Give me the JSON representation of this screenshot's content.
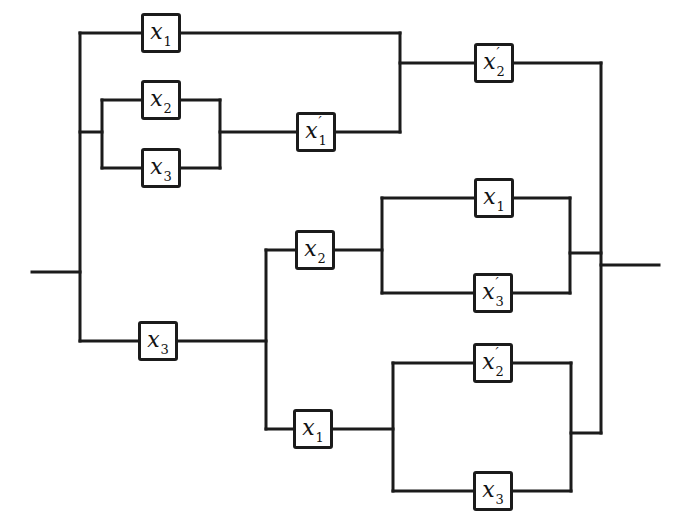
{
  "diagram": {
    "kind": "switching-circuit",
    "canvas": {
      "width": 673,
      "height": 530,
      "background": "#ffffff",
      "stroke": "#1b1b1b",
      "stroke_width": 3
    },
    "boxes": [
      {
        "name": "contact-x1-top",
        "cx": 161,
        "cy": 33,
        "label": {
          "base": "x",
          "prime": "",
          "sub": "1"
        }
      },
      {
        "name": "contact-x2-upper",
        "cx": 161,
        "cy": 100,
        "label": {
          "base": "x",
          "prime": "",
          "sub": "2"
        }
      },
      {
        "name": "contact-x3-upper",
        "cx": 161,
        "cy": 168,
        "label": {
          "base": "x",
          "prime": "",
          "sub": "3"
        }
      },
      {
        "name": "contact-x1-prime",
        "cx": 316,
        "cy": 132,
        "label": {
          "base": "x",
          "prime": "′",
          "sub": "1"
        }
      },
      {
        "name": "contact-x2-prime-top",
        "cx": 494,
        "cy": 63,
        "label": {
          "base": "x",
          "prime": "′",
          "sub": "2"
        }
      },
      {
        "name": "contact-x2-mid",
        "cx": 315,
        "cy": 250,
        "label": {
          "base": "x",
          "prime": "",
          "sub": "2"
        }
      },
      {
        "name": "contact-x1-mid",
        "cx": 494,
        "cy": 198,
        "label": {
          "base": "x",
          "prime": "",
          "sub": "1"
        }
      },
      {
        "name": "contact-x3-prime",
        "cx": 493,
        "cy": 293,
        "label": {
          "base": "x",
          "prime": "′",
          "sub": "3"
        }
      },
      {
        "name": "contact-x3-bottom-left",
        "cx": 158,
        "cy": 341,
        "label": {
          "base": "x",
          "prime": "",
          "sub": "3"
        }
      },
      {
        "name": "contact-x1-bottom",
        "cx": 313,
        "cy": 429,
        "label": {
          "base": "x",
          "prime": "",
          "sub": "1"
        }
      },
      {
        "name": "contact-x2-prime-bottom",
        "cx": 493,
        "cy": 363,
        "label": {
          "base": "x",
          "prime": "′",
          "sub": "2"
        }
      },
      {
        "name": "contact-x3-bottom-right",
        "cx": 493,
        "cy": 491,
        "label": {
          "base": "x",
          "prime": "",
          "sub": "3"
        }
      }
    ],
    "wires": [
      {
        "name": "input-lead",
        "x1": 32,
        "y1": 272,
        "x2": 80,
        "y2": 272
      },
      {
        "name": "left-bus",
        "x1": 80,
        "y1": 33,
        "x2": 80,
        "y2": 341
      },
      {
        "name": "top-branch-in",
        "x1": 80,
        "y1": 33,
        "x2": 145,
        "y2": 33
      },
      {
        "name": "top-branch-out",
        "x1": 177,
        "y1": 33,
        "x2": 400,
        "y2": 33
      },
      {
        "name": "par1-stub",
        "x1": 80,
        "y1": 132,
        "x2": 102,
        "y2": 132
      },
      {
        "name": "par1-left-bracket",
        "x1": 102,
        "y1": 100,
        "x2": 102,
        "y2": 168
      },
      {
        "name": "par1-x2-in",
        "x1": 102,
        "y1": 100,
        "x2": 145,
        "y2": 100
      },
      {
        "name": "par1-x2-out",
        "x1": 177,
        "y1": 100,
        "x2": 220,
        "y2": 100
      },
      {
        "name": "par1-x3-in",
        "x1": 102,
        "y1": 168,
        "x2": 145,
        "y2": 168
      },
      {
        "name": "par1-x3-out",
        "x1": 177,
        "y1": 168,
        "x2": 220,
        "y2": 168
      },
      {
        "name": "par1-right-bracket",
        "x1": 220,
        "y1": 100,
        "x2": 220,
        "y2": 168
      },
      {
        "name": "x1-prime-in",
        "x1": 220,
        "y1": 132,
        "x2": 300,
        "y2": 132
      },
      {
        "name": "x1-prime-out",
        "x1": 332,
        "y1": 132,
        "x2": 400,
        "y2": 132
      },
      {
        "name": "top-merge-bracket",
        "x1": 400,
        "y1": 33,
        "x2": 400,
        "y2": 132
      },
      {
        "name": "x2-prime-top-in",
        "x1": 400,
        "y1": 63,
        "x2": 478,
        "y2": 63
      },
      {
        "name": "x2-prime-top-out",
        "x1": 510,
        "y1": 63,
        "x2": 601,
        "y2": 63
      },
      {
        "name": "right-bus",
        "x1": 601,
        "y1": 63,
        "x2": 601,
        "y2": 433
      },
      {
        "name": "x3-bottom-in",
        "x1": 80,
        "y1": 341,
        "x2": 142,
        "y2": 341
      },
      {
        "name": "x3-bottom-out",
        "x1": 174,
        "y1": 341,
        "x2": 266,
        "y2": 341
      },
      {
        "name": "lower-split-bracket",
        "x1": 266,
        "y1": 250,
        "x2": 266,
        "y2": 429
      },
      {
        "name": "x2-mid-in",
        "x1": 266,
        "y1": 250,
        "x2": 299,
        "y2": 250
      },
      {
        "name": "x2-mid-out",
        "x1": 331,
        "y1": 250,
        "x2": 382,
        "y2": 250
      },
      {
        "name": "par2-left-bracket",
        "x1": 382,
        "y1": 198,
        "x2": 382,
        "y2": 293
      },
      {
        "name": "par2-x1-in",
        "x1": 382,
        "y1": 198,
        "x2": 478,
        "y2": 198
      },
      {
        "name": "par2-x1-out",
        "x1": 510,
        "y1": 198,
        "x2": 570,
        "y2": 198
      },
      {
        "name": "par2-x3-prime-in",
        "x1": 382,
        "y1": 293,
        "x2": 477,
        "y2": 293
      },
      {
        "name": "par2-x3-prime-out",
        "x1": 509,
        "y1": 293,
        "x2": 570,
        "y2": 293
      },
      {
        "name": "par2-right-bracket",
        "x1": 570,
        "y1": 198,
        "x2": 570,
        "y2": 293
      },
      {
        "name": "par2-out",
        "x1": 570,
        "y1": 253,
        "x2": 601,
        "y2": 253
      },
      {
        "name": "x1-bottom-in",
        "x1": 266,
        "y1": 429,
        "x2": 297,
        "y2": 429
      },
      {
        "name": "x1-bottom-out",
        "x1": 329,
        "y1": 429,
        "x2": 393,
        "y2": 429
      },
      {
        "name": "par3-left-bracket",
        "x1": 393,
        "y1": 363,
        "x2": 393,
        "y2": 491
      },
      {
        "name": "par3-x2-prime-in",
        "x1": 393,
        "y1": 363,
        "x2": 477,
        "y2": 363
      },
      {
        "name": "par3-x2-prime-out",
        "x1": 509,
        "y1": 363,
        "x2": 571,
        "y2": 363
      },
      {
        "name": "par3-x3-in",
        "x1": 393,
        "y1": 491,
        "x2": 477,
        "y2": 491
      },
      {
        "name": "par3-x3-out",
        "x1": 509,
        "y1": 491,
        "x2": 571,
        "y2": 491
      },
      {
        "name": "par3-right-bracket",
        "x1": 571,
        "y1": 363,
        "x2": 571,
        "y2": 491
      },
      {
        "name": "par3-out",
        "x1": 571,
        "y1": 433,
        "x2": 601,
        "y2": 433
      },
      {
        "name": "output-lead",
        "x1": 601,
        "y1": 265,
        "x2": 659,
        "y2": 265
      }
    ]
  }
}
